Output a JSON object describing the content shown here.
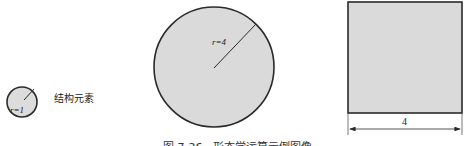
{
  "figure": {
    "caption": "图 7-26　形态学运算示例图像",
    "fill_color": "#d9d9d9",
    "stroke_color": "#2a2a2a"
  },
  "structuring_element": {
    "shape": "circle",
    "radius_label": "r=1",
    "title": "结构元素"
  },
  "disk": {
    "shape": "circle",
    "radius_label": "r=4"
  },
  "square": {
    "shape": "square",
    "width_label": "4"
  }
}
